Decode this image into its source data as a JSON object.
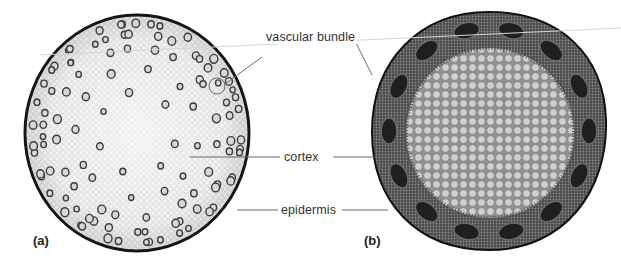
{
  "figure": {
    "panels": [
      {
        "id": "a",
        "label": "(a)",
        "description": "Monocot stem cross section with scattered vascular bundles"
      },
      {
        "id": "b",
        "label": "(b)",
        "description": "Dicot stem cross section with vascular bundles arranged in a ring"
      }
    ],
    "annotations": [
      {
        "key": "vascular_bundle",
        "text": "vascular bundle"
      },
      {
        "key": "cortex",
        "text": "cortex"
      },
      {
        "key": "epidermis",
        "text": "epidermis"
      }
    ]
  },
  "colors": {
    "line": "#6b6b6b",
    "epidermis_a": "#1a1a1a",
    "ground_a": "#ececec",
    "bundle_a": "#4a4a4a",
    "ground_b": "#b8b8b8",
    "ring_b": "#3a3a3a",
    "bundle_b": "#1f1f1f"
  }
}
